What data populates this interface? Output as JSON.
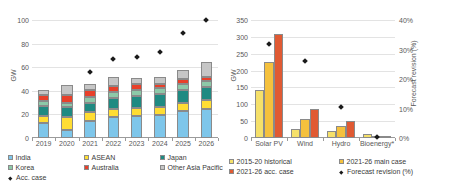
{
  "figure": {
    "panels": [
      "left-capacity-by-country",
      "right-capacity-by-technology"
    ]
  },
  "chart_data": [
    {
      "id": "left",
      "type": "bar",
      "subtype": "stacked-bar-with-scatter-overlay",
      "title": "",
      "xlabel": "",
      "ylabel": "GW",
      "ylim": [
        0,
        100
      ],
      "yticks": [
        0,
        20,
        40,
        60,
        80,
        100
      ],
      "ytick_labels": [
        "0",
        "20",
        "40",
        "60",
        "80",
        "100"
      ],
      "grid": true,
      "legend_position": "bottom",
      "categories": [
        "2019",
        "2020",
        "2021",
        "2022",
        "2023",
        "2024",
        "2025",
        "2026"
      ],
      "series": [
        {
          "name": "India",
          "color": "#7ec6ea",
          "values": [
            12.5,
            6.5,
            14.0,
            18.0,
            19.0,
            19.5,
            23.0,
            25.0
          ]
        },
        {
          "name": "ASEAN",
          "color": "#ffdd33",
          "values": [
            6.5,
            11.5,
            8.0,
            7.0,
            6.5,
            6.5,
            7.0,
            7.5
          ]
        },
        {
          "name": "Japan",
          "color": "#1f8a82",
          "values": [
            8.5,
            8.0,
            8.0,
            9.0,
            10.5,
            11.0,
            10.5,
            11.0
          ]
        },
        {
          "name": "Korea",
          "color": "#8dc9a8",
          "values": [
            4.0,
            4.0,
            4.5,
            5.0,
            5.0,
            5.0,
            5.0,
            4.5
          ]
        },
        {
          "name": "Australia",
          "color": "#e8402a",
          "values": [
            5.0,
            6.5,
            6.5,
            5.5,
            4.5,
            4.0,
            4.5,
            4.0
          ]
        },
        {
          "name": "Other Asia Pacific",
          "color": "#c6c6c6",
          "values": [
            4.5,
            8.5,
            5.0,
            7.5,
            5.0,
            5.5,
            8.0,
            12.0
          ]
        }
      ],
      "overlay": {
        "name": "Acc. case",
        "marker": "diamond",
        "color": "#1a1a1a",
        "values": [
          null,
          null,
          56,
          67,
          69,
          73,
          89,
          100
        ]
      }
    },
    {
      "id": "right",
      "type": "bar",
      "subtype": "grouped-bar-with-secondary-axis-scatter",
      "title": "",
      "xlabel": "",
      "ylabel": "GW",
      "ylim": [
        0,
        350
      ],
      "yticks": [
        0,
        50,
        100,
        150,
        200,
        250,
        300,
        350
      ],
      "ytick_labels": [
        "0",
        "50",
        "100",
        "150",
        "200",
        "250",
        "300",
        "350"
      ],
      "y2label": "Forecast revision (%)",
      "y2lim": [
        0,
        40
      ],
      "y2ticks": [
        0,
        10,
        20,
        30,
        40
      ],
      "y2tick_labels": [
        "0%",
        "10%",
        "20%",
        "30%",
        "40%"
      ],
      "grid": true,
      "legend_position": "bottom",
      "categories": [
        "Solar PV",
        "Wind",
        "Hydro",
        "Bioenergy*"
      ],
      "series": [
        {
          "name": "2015-20 historical",
          "color": "#f5e06a",
          "values": [
            143,
            27,
            21,
            11
          ]
        },
        {
          "name": "2021-26 main case",
          "color": "#f5c13d",
          "values": [
            224,
            56,
            35,
            6
          ]
        },
        {
          "name": "2021-26 acc. case",
          "color": "#e05a33",
          "values": [
            308,
            85,
            49,
            7
          ]
        }
      ],
      "overlay": {
        "name": "Forecast revision (%)",
        "marker": "diamond",
        "color": "#1a1a1a",
        "values": [
          32,
          26,
          10.5,
          0.3
        ]
      }
    }
  ],
  "left_chart": {
    "y_axis_title": "GW",
    "legend": [
      {
        "label": "India",
        "color": "#7ec6ea",
        "marker": "square"
      },
      {
        "label": "ASEAN",
        "color": "#ffdd33",
        "marker": "square"
      },
      {
        "label": "Japan",
        "color": "#1f8a82",
        "marker": "square"
      },
      {
        "label": "Korea",
        "color": "#8dc9a8",
        "marker": "square"
      },
      {
        "label": "Australia",
        "color": "#e8402a",
        "marker": "square"
      },
      {
        "label": "Other Asia Pacific",
        "color": "#c6c6c6",
        "marker": "square"
      },
      {
        "label": "Acc. case",
        "color": "#1a1a1a",
        "marker": "diamond"
      }
    ]
  },
  "right_chart": {
    "y_axis_title": "GW",
    "y2_axis_title": "Forecast revision (%)",
    "legend": [
      {
        "label": "2015-20 historical",
        "color": "#f5e06a",
        "marker": "square"
      },
      {
        "label": "2021-26 main case",
        "color": "#f5c13d",
        "marker": "square"
      },
      {
        "label": "2021-26 acc. case",
        "color": "#e05a33",
        "marker": "square"
      },
      {
        "label": "Forecast revision (%)",
        "color": "#1a1a1a",
        "marker": "diamond"
      }
    ]
  }
}
